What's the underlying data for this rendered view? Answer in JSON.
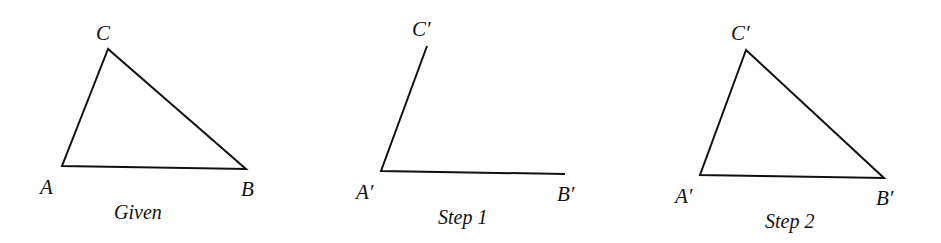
{
  "figures": [
    {
      "caption": "Given",
      "labels": {
        "A": "A",
        "B": "B",
        "C": "C"
      }
    },
    {
      "caption": "Step 1",
      "labels": {
        "A": "A′",
        "B": "B′",
        "C": "C′"
      }
    },
    {
      "caption": "Step 2",
      "labels": {
        "A": "A′",
        "B": "B′",
        "C": "C′"
      }
    }
  ]
}
